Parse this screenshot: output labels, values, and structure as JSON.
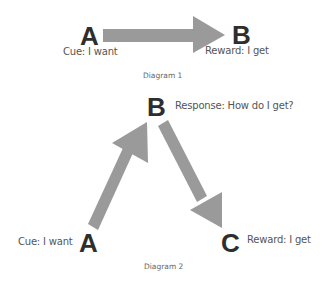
{
  "colors": {
    "arrow": "#9a9a9a",
    "node_text": "#2e2e2e",
    "label_text": "#555555"
  },
  "diagram1": {
    "node_a": "A",
    "node_b": "B",
    "cue_label": "Cue: I want",
    "reward_label": "Reward: I get",
    "caption": "Diagram 1"
  },
  "diagram2": {
    "node_a": "A",
    "node_b": "B",
    "node_c": "C",
    "cue_label": "Cue: I want",
    "response_label": "Response: How do I get?",
    "reward_label": "Reward: I get",
    "caption": "Diagram 2"
  }
}
